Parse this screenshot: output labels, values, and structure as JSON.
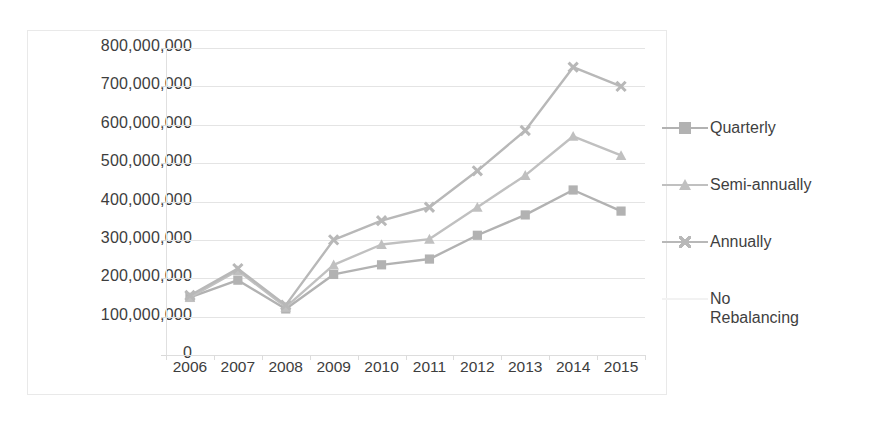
{
  "chart_data": {
    "type": "line",
    "title": "",
    "xlabel": "",
    "ylabel": "",
    "categories": [
      "2006",
      "2007",
      "2008",
      "2009",
      "2010",
      "2011",
      "2012",
      "2013",
      "2014",
      "2015"
    ],
    "ylim": [
      0,
      800000000
    ],
    "ytick_step": 100000000,
    "ytick_labels": [
      "800,000,000",
      "700,000,000",
      "600,000,000",
      "500,000,000",
      "400,000,000",
      "300,000,000",
      "200,000,000",
      "100,000,000",
      "0"
    ],
    "ytick_values": [
      800000000,
      700000000,
      600000000,
      500000000,
      400000000,
      300000000,
      200000000,
      100000000,
      0
    ],
    "grid": true,
    "legend_position": "right",
    "series": [
      {
        "name": "Quarterly",
        "marker": "square",
        "color": "#b2b2b2",
        "values": [
          150000000,
          195000000,
          120000000,
          210000000,
          235000000,
          250000000,
          312000000,
          365000000,
          430000000,
          375000000
        ]
      },
      {
        "name": "Semi-annually",
        "marker": "triangle",
        "color": "#c0c0c0",
        "values": [
          150000000,
          220000000,
          125000000,
          235000000,
          288000000,
          302000000,
          385000000,
          468000000,
          570000000,
          520000000
        ]
      },
      {
        "name": "Annually",
        "marker": "cross",
        "color": "#b8b8b8",
        "values": [
          155000000,
          225000000,
          130000000,
          300000000,
          350000000,
          385000000,
          480000000,
          585000000,
          750000000,
          700000000
        ]
      },
      {
        "name": "No\nRebalancing",
        "marker": "none",
        "color": "#f2f2f2",
        "values": [
          null,
          null,
          null,
          null,
          null,
          null,
          null,
          null,
          null,
          null
        ]
      }
    ]
  },
  "legend": {
    "entries": [
      {
        "label": "Quarterly"
      },
      {
        "label": "Semi-annually"
      },
      {
        "label": "Annually"
      },
      {
        "label": "No\nRebalancing"
      }
    ]
  },
  "colors": {
    "grid": "#e4e4e4",
    "axis": "#e0e0e0",
    "text": "#3d3d3d",
    "frame": "#e9e9e9",
    "background": "#ffffff"
  }
}
